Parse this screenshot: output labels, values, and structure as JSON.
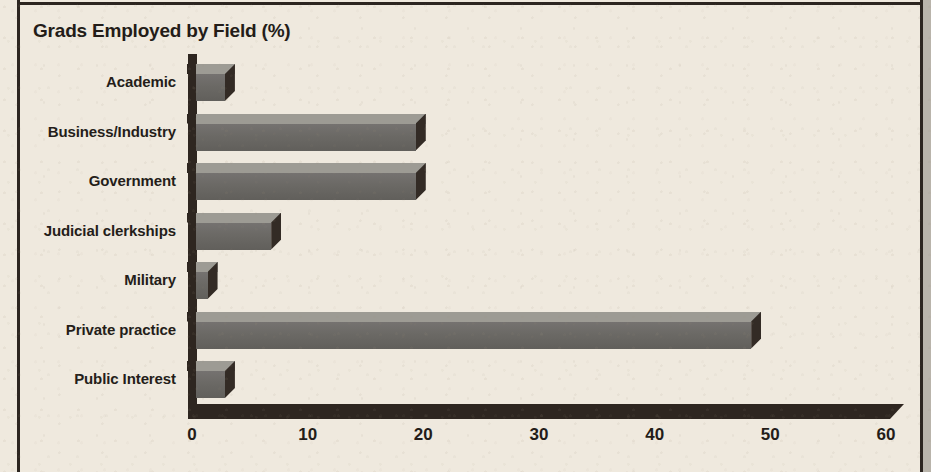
{
  "chart_data": {
    "type": "bar",
    "orientation": "horizontal",
    "title": "Grads Employed by Field (%)",
    "xlabel": "",
    "ylabel": "",
    "xlim": [
      0,
      60
    ],
    "xticks": [
      "0",
      "10",
      "20",
      "30",
      "40",
      "50",
      "60"
    ],
    "grid": false,
    "legend": "none",
    "style": "3d-blocks",
    "categories": [
      "Academic",
      "Business/Industry",
      "Government",
      "Judicial clerkships",
      "Military",
      "Private practice",
      "Public Interest"
    ],
    "values": [
      2.5,
      19,
      19,
      6.5,
      1,
      48,
      2.5
    ],
    "colors": {
      "bar_front": "#6d6b66",
      "bar_top": "#9d9b94",
      "bar_side": "#332b25",
      "axis": "#2e2620",
      "text": "#231c18",
      "background": "#efe9de"
    }
  },
  "frame": {
    "rule_left": "vertical-rule",
    "rule_top": "horizontal-rule",
    "rule_right": "vertical-rule",
    "gutter": "page-gutter"
  }
}
